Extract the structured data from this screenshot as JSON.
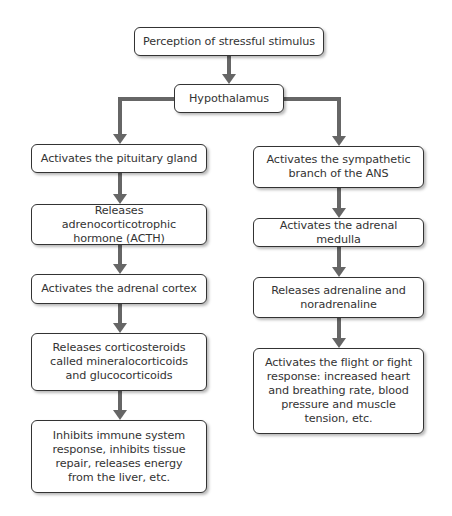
{
  "diagram": {
    "colors": {
      "arrow": "#666666",
      "box_border": "#333333",
      "box_fill": "#ffffff",
      "text": "#333333"
    },
    "top": {
      "stimulus": "Perception of stressful stimulus",
      "hypothalamus": "Hypothalamus"
    },
    "left_branch": [
      {
        "label": "Activates the pituitary gland"
      },
      {
        "label": "Releases adrenocorticotrophic\nhormone (ACTH)"
      },
      {
        "label": "Activates the adrenal cortex"
      },
      {
        "label": "Releases corticosteroids\ncalled mineralocorticoids\nand glucocorticoids"
      },
      {
        "label": "Inhibits immune system\nresponse, inhibits tissue\nrepair, releases energy\nfrom the liver, etc."
      }
    ],
    "right_branch": [
      {
        "label": "Activates the sympathetic\nbranch of the ANS"
      },
      {
        "label": "Activates the adrenal medulla"
      },
      {
        "label": "Releases adrenaline and\nnoradrenaline"
      },
      {
        "label": "Activates the flight or fight\nresponse: increased heart\nand breathing rate, blood\npressure and muscle\ntension, etc."
      }
    ]
  }
}
